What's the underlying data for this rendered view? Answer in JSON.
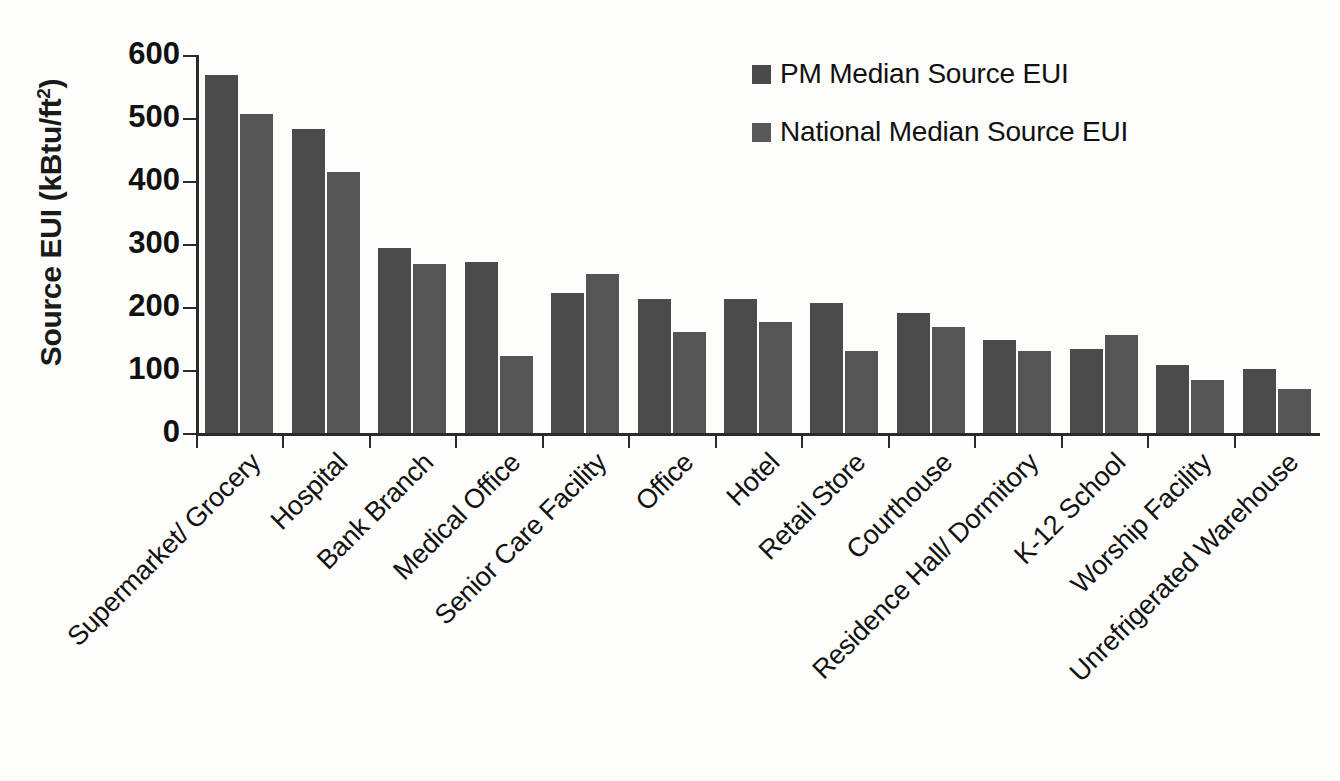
{
  "chart_data": {
    "type": "bar",
    "title": "",
    "xlabel": "",
    "ylabel": "Source EUI (kBtu/ft²)",
    "ylim": [
      0,
      600
    ],
    "ytick_labels": [
      "600",
      "500",
      "400",
      "300",
      "200",
      "100",
      "0"
    ],
    "ytick_values": [
      600,
      500,
      400,
      300,
      200,
      100,
      0
    ],
    "grid": false,
    "legend_position": "top-center-right",
    "categories": [
      "Supermarket/ Grocery",
      "Hospital",
      "Bank Branch",
      "Medical Office",
      "Senior Care Facility",
      "Office",
      "Hotel",
      "Retail Store",
      "Courthouse",
      "Residence Hall/ Dormitory",
      "K-12 School",
      "Worship Facility",
      "Unrefrigerated Warehouse"
    ],
    "series": [
      {
        "name": "PM Median Source EUI",
        "color": "#4b4b4b",
        "values": [
          568,
          483,
          293,
          271,
          223,
          212,
          213,
          206,
          191,
          148,
          134,
          108,
          101
        ]
      },
      {
        "name": "National Median Source EUI",
        "color": "#555555",
        "values": [
          506,
          415,
          269,
          123,
          252,
          160,
          177,
          130,
          168,
          130,
          156,
          84,
          70
        ]
      }
    ]
  },
  "axis": {
    "y_title_main": "Source EUI (kBtu/ft",
    "y_title_sup": "2",
    "y_title_close": ")"
  },
  "legend": {
    "items": [
      {
        "label": "PM Median Source EUI"
      },
      {
        "label": "National Median Source EUI"
      }
    ]
  }
}
